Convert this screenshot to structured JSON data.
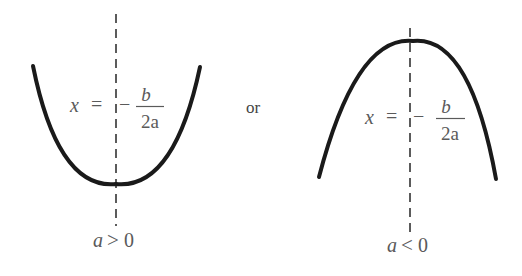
{
  "figure": {
    "type": "two parabolas with axis of symmetry",
    "separator_word": "or",
    "colors": {
      "curve": "#1a1a1a",
      "axis": "#333333",
      "text": "#5a5a5a",
      "background": "#ffffff"
    }
  },
  "left_panel": {
    "shape": "parabola opening upward",
    "axis_label": {
      "var": "x",
      "equals": "=",
      "minus": "−",
      "numerator": "b",
      "denominator": "2a"
    },
    "condition": {
      "var": "a",
      "relation": ">",
      "value": "0"
    }
  },
  "right_panel": {
    "shape": "parabola opening downward",
    "axis_label": {
      "var": "x",
      "equals": "=",
      "minus": "−",
      "numerator": "b",
      "denominator": "2a"
    },
    "condition": {
      "var": "a",
      "relation": "<",
      "value": "0"
    }
  }
}
